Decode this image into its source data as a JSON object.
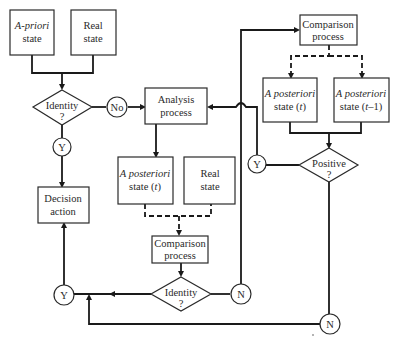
{
  "diagram": {
    "title": "",
    "nodes": {
      "apriori_state": {
        "line1": "A-priori",
        "line2": "state"
      },
      "real_state_top": {
        "line1": "Real",
        "line2": "state"
      },
      "identity_top": {
        "line1": "Identity",
        "line2": "?"
      },
      "no_circle": {
        "label": "No"
      },
      "y_circle_top": {
        "label": "Y"
      },
      "analysis_process": {
        "line1": "Analysis",
        "line2": "process"
      },
      "decision_action": {
        "line1": "Decision",
        "line2": "action"
      },
      "aposteriori_mid": {
        "line1": "A posteriori",
        "line2a": "state (",
        "line2b": "t",
        "line2c": ")"
      },
      "real_state_mid": {
        "line1": "Real",
        "line2": "state"
      },
      "comparison_mid": {
        "line1": "Comparison",
        "line2": "process"
      },
      "identity_bottom": {
        "line1": "Identity",
        "line2": "?"
      },
      "y_circle_bottom": {
        "label": "Y"
      },
      "n_circle_mid": {
        "label": "N"
      },
      "comparison_top": {
        "line1": "Comparison",
        "line2": "process"
      },
      "aposteriori_t": {
        "line1": "A posteriori",
        "line2a": "state (",
        "line2b": "t",
        "line2c": ")"
      },
      "aposteriori_t1": {
        "line1": "A posteriori",
        "line2a": "state (",
        "line2b": "t",
        "line2c": "–1)"
      },
      "positive": {
        "line1": "Positive",
        "line2": "?"
      },
      "y_circle_right": {
        "label": "Y"
      },
      "n_circle_bottom": {
        "label": "N"
      }
    },
    "edges": [
      {
        "from": "apriori_state",
        "to": "identity_top",
        "style": "solid"
      },
      {
        "from": "real_state_top",
        "to": "identity_top",
        "style": "solid"
      },
      {
        "from": "identity_top",
        "to": "analysis_process",
        "via": "no_circle",
        "style": "solid"
      },
      {
        "from": "identity_top",
        "to": "decision_action",
        "via": "y_circle_top",
        "style": "solid"
      },
      {
        "from": "analysis_process",
        "to": "aposteriori_mid",
        "style": "solid"
      },
      {
        "from": "aposteriori_mid",
        "to": "comparison_mid",
        "style": "dashed"
      },
      {
        "from": "real_state_mid",
        "to": "comparison_mid",
        "style": "dashed"
      },
      {
        "from": "comparison_mid",
        "to": "identity_bottom",
        "style": "solid"
      },
      {
        "from": "identity_bottom",
        "to": "y_circle_bottom",
        "style": "solid"
      },
      {
        "from": "y_circle_bottom",
        "to": "decision_action",
        "style": "solid"
      },
      {
        "from": "identity_bottom",
        "to": "comparison_top",
        "via": "n_circle_mid",
        "style": "solid"
      },
      {
        "from": "comparison_top",
        "to": "aposteriori_t",
        "style": "dashed"
      },
      {
        "from": "comparison_top",
        "to": "aposteriori_t1",
        "style": "dashed"
      },
      {
        "from": "aposteriori_t",
        "to": "positive",
        "style": "solid"
      },
      {
        "from": "aposteriori_t1",
        "to": "positive",
        "style": "solid"
      },
      {
        "from": "positive",
        "to": "analysis_process",
        "via": "y_circle_right",
        "style": "solid"
      },
      {
        "from": "positive",
        "to": "y_circle_bottom",
        "via": "n_circle_bottom",
        "style": "solid"
      }
    ],
    "colors": {
      "stroke": "#1a1a1a",
      "text": "#2a2a2a",
      "background": "#ffffff"
    }
  }
}
